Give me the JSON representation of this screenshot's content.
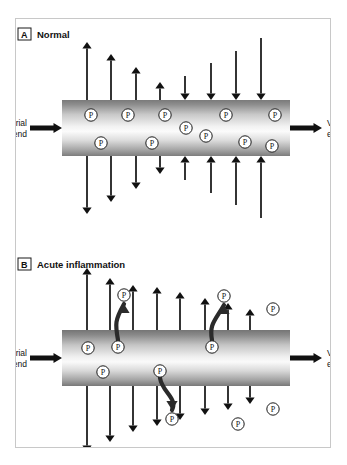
{
  "figure": {
    "title_text": "Capillary fluid and protein movement: normal versus acute inflammation",
    "background_color": "#ffffff",
    "frame_border_color": "#c8c8c8",
    "ink_color": "#111111",
    "protein_marker_label": "P"
  },
  "panels": [
    {
      "tag": "A",
      "title": "Normal",
      "arterial_label_line1": "Arterial",
      "arterial_label_line2": "end",
      "venous_label_line1": "Venous",
      "venous_label_line2": "end",
      "vessel": {
        "x": 62,
        "y": 100,
        "width": 228,
        "height": 56
      },
      "flow_in_arrow": {
        "x": 30,
        "y": 128,
        "length": 32
      },
      "flow_out_arrow": {
        "x": 290,
        "y": 128,
        "length": 32
      },
      "arrows_out_up": [
        {
          "x": 87,
          "len": 58
        },
        {
          "x": 111,
          "len": 46
        },
        {
          "x": 136,
          "len": 33
        },
        {
          "x": 160,
          "len": 18
        }
      ],
      "arrows_in_down": [
        {
          "x": 185,
          "len": 24
        },
        {
          "x": 211,
          "len": 37
        },
        {
          "x": 236,
          "len": 49
        },
        {
          "x": 261,
          "len": 62
        }
      ],
      "arrows_out_down": [
        {
          "x": 87,
          "len": 58
        },
        {
          "x": 111,
          "len": 46
        },
        {
          "x": 136,
          "len": 33
        },
        {
          "x": 160,
          "len": 18
        }
      ],
      "arrows_in_up": [
        {
          "x": 185,
          "len": 24
        },
        {
          "x": 211,
          "len": 37
        },
        {
          "x": 236,
          "len": 49
        },
        {
          "x": 261,
          "len": 62
        }
      ],
      "proteins_inside": [
        {
          "x": 91,
          "y": 115
        },
        {
          "x": 128,
          "y": 115
        },
        {
          "x": 165,
          "y": 115
        },
        {
          "x": 186,
          "y": 128
        },
        {
          "x": 206,
          "y": 136
        },
        {
          "x": 226,
          "y": 115
        },
        {
          "x": 275,
          "y": 115
        },
        {
          "x": 101,
          "y": 143
        },
        {
          "x": 152,
          "y": 143
        },
        {
          "x": 245,
          "y": 142
        },
        {
          "x": 272,
          "y": 146
        }
      ],
      "proteins_outside": []
    },
    {
      "tag": "B",
      "title": "Acute inflammation",
      "arterial_label_line1": "Arterial",
      "arterial_label_line2": "end",
      "venous_label_line1": "Venous",
      "venous_label_line2": "end",
      "vessel": {
        "x": 62,
        "y": 330,
        "width": 228,
        "height": 56
      },
      "flow_in_arrow": {
        "x": 30,
        "y": 358,
        "length": 32
      },
      "flow_out_arrow": {
        "x": 290,
        "y": 358,
        "length": 32
      },
      "arrows_out_up": [
        {
          "x": 87,
          "len": 62
        },
        {
          "x": 110,
          "len": 52
        },
        {
          "x": 133,
          "len": 45
        },
        {
          "x": 157,
          "len": 43
        },
        {
          "x": 180,
          "len": 38
        },
        {
          "x": 205,
          "len": 32
        },
        {
          "x": 228,
          "len": 27
        },
        {
          "x": 250,
          "len": 21
        }
      ],
      "arrows_out_down": [
        {
          "x": 87,
          "len": 66
        },
        {
          "x": 110,
          "len": 56
        },
        {
          "x": 133,
          "len": 46
        },
        {
          "x": 157,
          "len": 40
        },
        {
          "x": 180,
          "len": 34
        },
        {
          "x": 205,
          "len": 29
        },
        {
          "x": 228,
          "len": 24
        },
        {
          "x": 250,
          "len": 18
        }
      ],
      "proteins_inside": [
        {
          "x": 88,
          "y": 348
        },
        {
          "x": 118,
          "y": 347
        },
        {
          "x": 212,
          "y": 347
        },
        {
          "x": 103,
          "y": 372
        },
        {
          "x": 160,
          "y": 371
        }
      ],
      "proteins_outside": [
        {
          "x": 124,
          "y": 295
        },
        {
          "x": 224,
          "y": 296
        },
        {
          "x": 273,
          "y": 309
        },
        {
          "x": 172,
          "y": 419
        },
        {
          "x": 238,
          "y": 424
        },
        {
          "x": 273,
          "y": 409
        }
      ],
      "escape_curves": [
        {
          "from_x": 118,
          "from_y": 347,
          "to_x": 124,
          "to_y": 295,
          "direction": "up"
        },
        {
          "from_x": 212,
          "from_y": 347,
          "to_x": 224,
          "to_y": 296,
          "direction": "up"
        },
        {
          "from_x": 160,
          "from_y": 371,
          "to_x": 172,
          "to_y": 419,
          "direction": "down"
        }
      ]
    }
  ],
  "legend_notes": {
    "p_meaning": "P",
    "panel_a_meaning": "Normal",
    "panel_b_meaning": "Acute inflammation"
  }
}
